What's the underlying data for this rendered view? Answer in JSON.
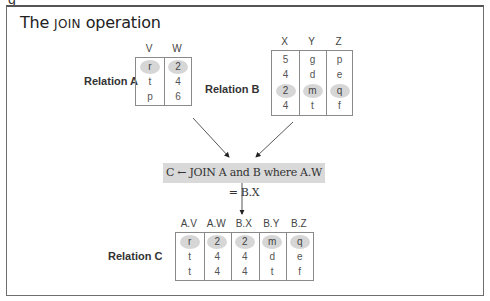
{
  "figure": {
    "title_prefix": "The ",
    "title_keyword": "JOIN",
    "title_suffix": " operation",
    "operation": "C ← JOIN A and B where A.W = B.X"
  },
  "relation_a": {
    "label": "Relation A",
    "columns": [
      "V",
      "W"
    ],
    "rows": [
      [
        "r",
        "2"
      ],
      [
        "t",
        "4"
      ],
      [
        "p",
        "6"
      ]
    ],
    "highlighted_row": 0
  },
  "relation_b": {
    "label": "Relation B",
    "columns": [
      "X",
      "Y",
      "Z"
    ],
    "rows": [
      [
        "5",
        "g",
        "p"
      ],
      [
        "4",
        "d",
        "e"
      ],
      [
        "2",
        "m",
        "q"
      ],
      [
        "4",
        "t",
        "f"
      ]
    ],
    "highlighted_row": 2
  },
  "relation_c": {
    "label": "Relation C",
    "columns": [
      "A.V",
      "A.W",
      "B.X",
      "B.Y",
      "B.Z"
    ],
    "rows": [
      [
        "r",
        "2",
        "2",
        "m",
        "q"
      ],
      [
        "t",
        "4",
        "4",
        "d",
        "e"
      ],
      [
        "t",
        "4",
        "4",
        "t",
        "f"
      ]
    ],
    "highlighted_row": 0
  },
  "colors": {
    "highlight": "#d6d6d6",
    "op_box": "#d9d9d9",
    "border": "#8a8a8a"
  }
}
